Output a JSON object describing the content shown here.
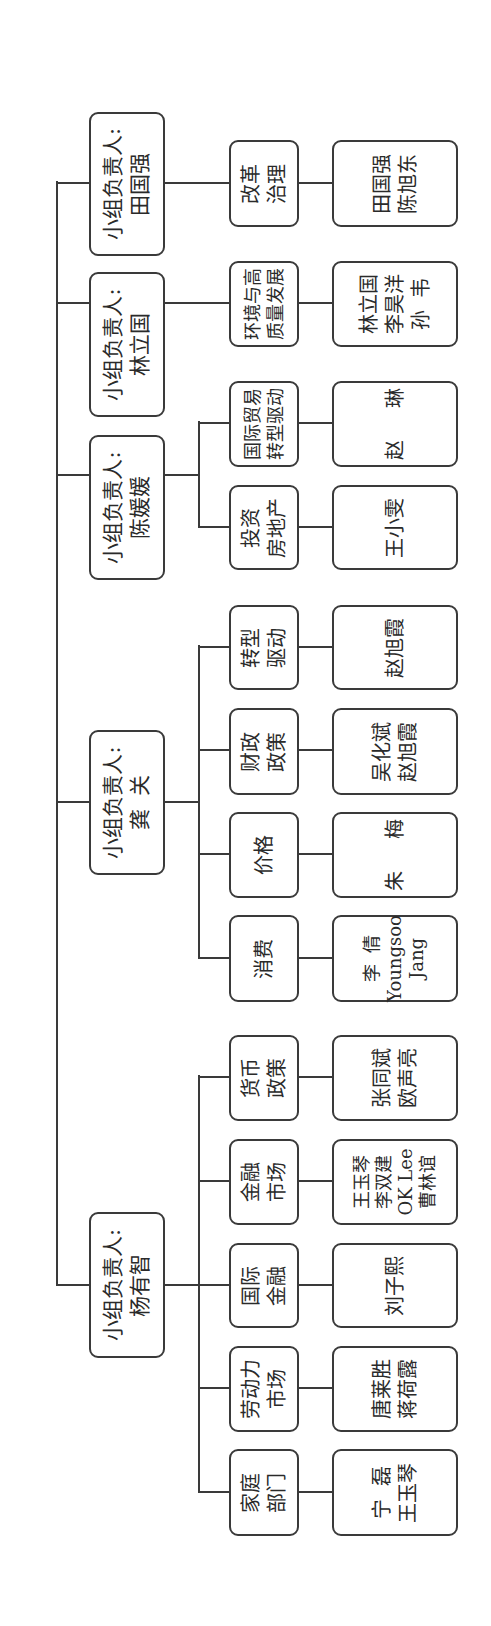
{
  "diagram": {
    "type": "org-chart",
    "orientation": "rotated-90-ccw",
    "groups": [
      {
        "leader_label": "小组负责人:",
        "leader_name": "杨有智",
        "topics": [
          {
            "label": [
              "家庭",
              "部门"
            ],
            "members": [
              "宁  磊",
              "王玉琴"
            ]
          },
          {
            "label": [
              "劳动力",
              "市场"
            ],
            "members": [
              "唐莱胜",
              "蒋荷露"
            ]
          },
          {
            "label": [
              "国际",
              "金融"
            ],
            "members": [
              "刘子熙"
            ]
          },
          {
            "label": [
              "金融",
              "市场"
            ],
            "members": [
              "王玉琴",
              "李双建",
              "OK Lee",
              "曹林谊"
            ]
          },
          {
            "label": [
              "货币",
              "政策"
            ],
            "members": [
              "张同斌",
              "欧声亮"
            ]
          }
        ]
      },
      {
        "leader_label": "小组负责人:",
        "leader_name": "龚  关",
        "topics": [
          {
            "label": [
              "消费"
            ],
            "members": [
              "李  倩",
              "Youngsoo",
              "Jang"
            ]
          },
          {
            "label": [
              "价格"
            ],
            "members": [
              "朱     梅"
            ]
          },
          {
            "label": [
              "财政",
              "政策"
            ],
            "members": [
              "吴化斌",
              "赵旭霞"
            ]
          },
          {
            "label": [
              "转型",
              "驱动"
            ],
            "members": [
              "赵旭霞"
            ]
          }
        ]
      },
      {
        "leader_label": "小组负责人:",
        "leader_name": "陈媛媛",
        "topics": [
          {
            "label": [
              "投资",
              "房地产"
            ],
            "members": [
              "王小雯"
            ]
          },
          {
            "label": [
              "国际贸易",
              "转型驱动"
            ],
            "members": [
              "赵     琳"
            ]
          }
        ]
      },
      {
        "leader_label": "小组负责人:",
        "leader_name": "林立国",
        "topics": [
          {
            "label": [
              "环境与高",
              "质量发展"
            ],
            "members": [
              "林立国",
              "李昊洋",
              "孙  韦"
            ]
          }
        ]
      },
      {
        "leader_label": "小组负责人:",
        "leader_name": "田国强",
        "topics": [
          {
            "label": [
              "改革",
              "治理"
            ],
            "members": [
              "田国强",
              "陈旭东"
            ]
          }
        ]
      }
    ]
  }
}
